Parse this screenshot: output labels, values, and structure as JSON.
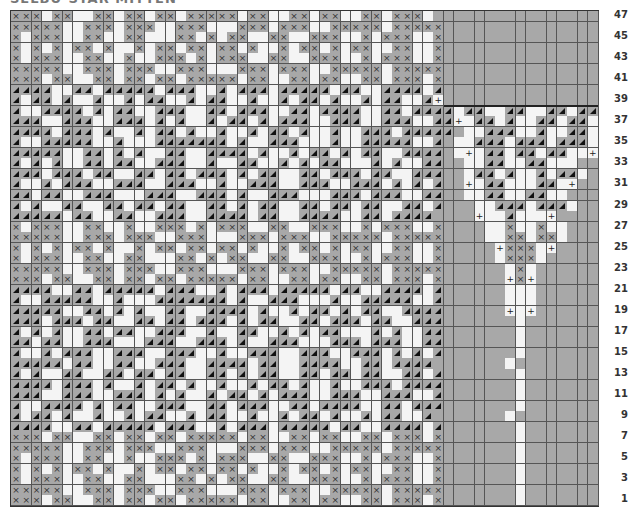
{
  "title": "SELBU-STAR MITTEN",
  "grid": {
    "columns": 57,
    "rows": 47,
    "cell_width": 10.3,
    "cell_height": 10.53,
    "legend": {
      "x": "gray stitch with cross",
      "t": "gray stitch with triangle",
      ".": "white background stitch",
      "g": "gray (no stitch / outside pattern)",
      "+": "increase marker"
    },
    "colors": {
      "gray": "#a8a8a8",
      "white": "#f4f4f4",
      "line": "#555555"
    },
    "main_columns": 42,
    "row_patterns": {
      "47": "xxx.xx..xx.xx.xx.xxxxx.xx..xx.xx..xx.xxx.gggggggggggggggg",
      "46": "xxxxx..xxx.xxx..xxx...xxx.xxx..xxxxx.xxxxxgggggggggggggggg",
      "45": "x.xxx..xx..xx...xx.x.xx..xx..xxx..x.xxx..xgggggggggggggggg",
      "44": "x.x.x.xx.x..x.xx.xx.xx.x..x.xx.x.xx..xx..xgggggggggggggggg",
      "43": "x.xxx..xx..x..xxx.x.xxx..xx..xxx..x.xxx..xgggggggggggggggg",
      "42": "xxxxx..xxx.xxx..xxx...xxx.xxx..xxxxx.xxxxxgggggggggggggggg",
      "41": "xxx.xx..xx.xx.xx.xxxxx.xx..xx.xx..xx.xxx.xgggggggggggggggg",
      "40": "tttt..tt.ttttt.ttt..t.ttt.ttttt.tt..tttt.tgggggggggggggggg",
      "39": "t.tt.t..t..t.tt..t.tt..t..t.tt.t..t.tt..t+gggggggggggggggg",
      "38": "t..tttt.t.tt..ttt..tt.ttt..tt.tttt..tt.tttt.tt..tt..tt.ttt.",
      "37": "ttt..ttt..ttt.t.t..t.tt.t.ttt..ttt..ttt..tt+.tt.t..tt.tt.+",
      "36": "tttt.ttt.t..t.tt.t..t..t.tt.t..t..ttt.tttttg..ttt..t..tt.gg",
      "35": "t..ttttt..t...ttttttt.t..ttt...t..ttttt..tg..ttt.ttt.ttt.gg",
      "34": "ttttt..tt.t.t..tt..tttt.t..t.tt.t.tt..ttttg.+.tt.tt.tt..+gg",
      "33": "t.t.t..tt.tt..ttt..t..tt..t.t.tt...t.t..ttgg..tt..tt...ggg",
      "32": "ttt.ttt.tt..tt.tt.ttt.t.tt..tt.ttt.tt..tttgg.tt.t..t.tt.ggg",
      "31": "t..t.ttt..ttt..ttt..t..ttt..ttt..ttt.t.t.tgg+.tt...tt.+ggg",
      "30": "tt.tt..ttt...ttt..ttt.t..ttt...ttt.ttt..ttgg..tt..tt..gggg",
      "29": "t.t..tt..tt.tt.tt..tt.t.tt..tt.tt.tt..tt.tggg..ttt.ttt.gggg",
      "28": "ttttt.tt..tt..ttt..tttt.tt..tttt..tt.ttttgggg+..t...+ggggg",
      "27": "x.xxx..xx..x..xxx.x.xxx..xx..xxx..x.xxx..xgggg..x..x..ggggg",
      "26": "xxxxx..xxx.xxx..xxx...xxx.xxx..xxxxx.xxxxxgggg..xx.xx.ggggg",
      "25": "x.x.x.xx.x..x.xx.xx.xx.x..x.xx.x.xx..xx..xggggg+xxx.+gggggg",
      "24": "x.xxx..xx..xx...xx.x.xx..xx..xxx..x.xxx..xggggg.xxx.gggggg",
      "23": "xxxxx..xxx.xxx..xxx...xxx.xxx..xxxxx.xxxxxgggggg.x.ggggggg",
      "22": "xxx.xx..xx.xx.xx.xxxxx.xx..xx.xx..xx.xxx.xgggggg+x+ggggggg",
      "21": "tttt..tt.ttttt.ttt..t.ttt.ttttt.tt..tttt.tgggggg...ggggggg",
      "20": "t..ttttt..t...ttttttt.t..ttt...t..ttttt..tgggggg...ggggggg",
      "19": "ttttt..tt.t.t..tt..tttt.t..t.tt.t.tt..ttttgggggg+.+ggggggg",
      "18": "ttt.ttt.tt..tt.tt.ttt.t.tt..tt.ttt.tt..tttggggggg.gggggggg",
      "17": "t.t.t..tt.tt..ttt..t..tt..t.t.tt...t.t..ttggggggg.gggggggg",
      "16": "tt.tt..ttt...ttt..ttt.t..ttt...ttt.ttt..ttggggggg.gggggggg",
      "15": "t..t.ttt..ttt..ttt..t..ttt..ttt..ttt.t.t.tggggggg.gggggggg",
      "14": "ttttt.tt..tt..ttt..tttt.tt..tttt..tt.ttttggggggg.gggggggg",
      "13": "t.t..tt..tt.tt.tt..tt.t.tt..tt.tt.tt..tt.tggggggg.gggggggg",
      "12": "tttt.ttt.t..t.tt.t..t..t.tt.t..t..ttt.ttttggggggg.gggggggg",
      "11": "ttt..ttt..ttt.t.t..t.tt.t.ttt..ttt..ttt..tggggggg.gggggggg",
      "10": "t..tttt.t.tt..ttt..tt.ttt..tt.tttt..tt.tttggggggg.gggggggg",
      "9": "t.tt.t..t..t.tt..t.tt..t..t.tt.t..t.tt..tggggggg.gggggggg",
      "8": "tttt..tt.ttttt.ttt..t.ttt.ttttt.tt..tttt.tggggggg.gggggggg",
      "7": "xxx.xx..xx.xx.xx.xxxxx.xx..xx.xx..xx.xxx.xggggggg.gggggggg",
      "6": "xxxxx..xxx.xxx..xxx...xxx.xxx..xxxxx.xxxxxggggggg.gggggggg",
      "5": "x.xxx..xx..x..xxx.x.xxx..xx..xxx..x.xxx..xggggggg.gggggggg",
      "4": "x.x.x.xx.x..x.xx.xx.xx.x..x.xx.x.xx..xx..xggggggg.gggggggg",
      "3": "x.xxx..xx..xx...xx.x.xx..xx..xxx..x.xxx..xggggggg.gggggggg",
      "2": "xxxxx..xxx.xxx..xxx...xxx.xxx..xxxxx.xxxxxggggggg.gggggggg",
      "1": "xxx.xx..xx.xx.xx.xxxxx.xx..xx.xx..xx.xxx.xggggggg.gggggggg"
    }
  },
  "row_labels": [
    "47",
    "45",
    "43",
    "41",
    "39",
    "37",
    "35",
    "33",
    "31",
    "29",
    "27",
    "25",
    "23",
    "21",
    "19",
    "17",
    "15",
    "13",
    "11",
    "9",
    "7",
    "5",
    "3",
    "1"
  ],
  "divider_after_row": 39
}
